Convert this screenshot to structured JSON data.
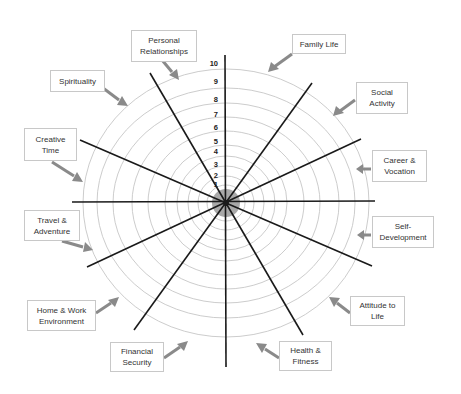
{
  "diagram": {
    "type": "wheel_of_life",
    "center": {
      "x": 226,
      "y": 203
    },
    "scale": [
      "1",
      "2",
      "3",
      "4",
      "5",
      "6",
      "7",
      "8",
      "9",
      "10"
    ],
    "colors": {
      "ring": "#c6c6c6",
      "spoke": "#1a1a1a",
      "hub": "#9a9a9a",
      "arrow": "#8a8a8a",
      "box_border": "#c8c8c8",
      "text": "#333333"
    },
    "categories": [
      {
        "label": "Family Life",
        "box": {
          "x": 292,
          "y": 34,
          "w": 54,
          "h": 20
        }
      },
      {
        "label": "Social\nActivity",
        "box": {
          "x": 356,
          "y": 82,
          "w": 52,
          "h": 32
        }
      },
      {
        "label": "Career &\nVocation",
        "box": {
          "x": 372,
          "y": 150,
          "w": 55,
          "h": 32
        }
      },
      {
        "label": "Self-\nDevelopment",
        "box": {
          "x": 372,
          "y": 216,
          "w": 62,
          "h": 32
        }
      },
      {
        "label": "Attitude to\nLife",
        "box": {
          "x": 350,
          "y": 296,
          "w": 55,
          "h": 30
        }
      },
      {
        "label": "Health &\nFitness",
        "box": {
          "x": 279,
          "y": 341,
          "w": 53,
          "h": 30
        }
      },
      {
        "label": "Financial\nSecurity",
        "box": {
          "x": 110,
          "y": 342,
          "w": 54,
          "h": 30
        }
      },
      {
        "label": "Home & Work\nEnvironment",
        "box": {
          "x": 27,
          "y": 300,
          "w": 69,
          "h": 31
        }
      },
      {
        "label": "Travel &\nAdventure",
        "box": {
          "x": 24,
          "y": 210,
          "w": 56,
          "h": 31
        }
      },
      {
        "label": "Creative\nTime",
        "box": {
          "x": 24,
          "y": 128,
          "w": 53,
          "h": 33
        }
      },
      {
        "label": "Spirituality",
        "box": {
          "x": 50,
          "y": 70,
          "w": 55,
          "h": 22
        }
      },
      {
        "label": "Personal\nRelationships",
        "box": {
          "x": 131,
          "y": 30,
          "w": 66,
          "h": 32
        }
      }
    ]
  }
}
